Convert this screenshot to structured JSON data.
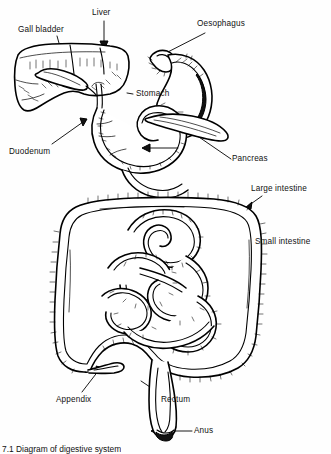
{
  "figure": {
    "caption": "7.1  Diagram of digestive system",
    "style": "black and white line drawing",
    "background_color": "#fefefe",
    "line_color": "#000000"
  },
  "labels": [
    {
      "id": "gall-bladder",
      "text": "Gall bladder",
      "x": 18,
      "y": 25
    },
    {
      "id": "liver",
      "text": "Liver",
      "x": 92,
      "y": 8
    },
    {
      "id": "oesophagus",
      "text": "Oesophagus",
      "x": 197,
      "y": 19
    },
    {
      "id": "stomach",
      "text": "Stomach",
      "x": 136,
      "y": 89
    },
    {
      "id": "duodenum",
      "text": "Duodenum",
      "x": 9,
      "y": 147
    },
    {
      "id": "pancreas",
      "text": "Pancreas",
      "x": 232,
      "y": 154
    },
    {
      "id": "large-intestine",
      "text": "Large intestine",
      "x": 251,
      "y": 184
    },
    {
      "id": "small-intestine",
      "text": "Small intestine",
      "x": 255,
      "y": 237
    },
    {
      "id": "appendix",
      "text": "Appendix",
      "x": 56,
      "y": 395
    },
    {
      "id": "rectum",
      "text": "Rectum",
      "x": 161,
      "y": 395
    },
    {
      "id": "anus",
      "text": "Anus",
      "x": 194,
      "y": 426
    }
  ],
  "organs": [
    {
      "id": "liver",
      "name": "Liver"
    },
    {
      "id": "gall-bladder",
      "name": "Gall bladder"
    },
    {
      "id": "oesophagus",
      "name": "Oesophagus"
    },
    {
      "id": "stomach",
      "name": "Stomach"
    },
    {
      "id": "duodenum",
      "name": "Duodenum"
    },
    {
      "id": "pancreas",
      "name": "Pancreas"
    },
    {
      "id": "small-intestine",
      "name": "Small intestine"
    },
    {
      "id": "large-intestine",
      "name": "Large intestine"
    },
    {
      "id": "appendix",
      "name": "Appendix"
    },
    {
      "id": "rectum",
      "name": "Rectum"
    },
    {
      "id": "anus",
      "name": "Anus"
    }
  ]
}
